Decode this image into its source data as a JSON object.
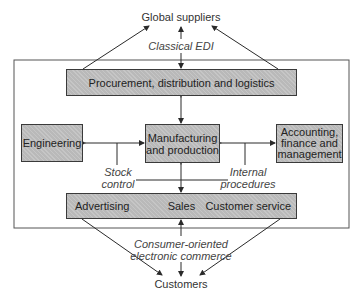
{
  "external": {
    "top": "Global suppliers",
    "bottom": "Customers"
  },
  "channels": {
    "top": "Classical EDI",
    "bottom_line1": "Consumer-oriented",
    "bottom_line2": "electronic commerce"
  },
  "boxes": {
    "procurement": "Procurement, distribution and logistics",
    "engineering": "Engineering",
    "manufacturing_line1": "Manufacturing",
    "manufacturing_line2": "and production",
    "accounting_line1": "Accounting,",
    "accounting_line2": "finance and",
    "accounting_line3": "management",
    "sales_box": {
      "advertising": "Advertising",
      "sales": "Sales",
      "customer_service": "Customer service"
    }
  },
  "connectors": {
    "stock_line1": "Stock",
    "stock_line2": "control",
    "internal_line1": "Internal",
    "internal_line2": "procedures"
  },
  "colors": {
    "box_fill": "#b9b9b9",
    "stroke": "#2a2a2a",
    "frame": "#555555"
  }
}
